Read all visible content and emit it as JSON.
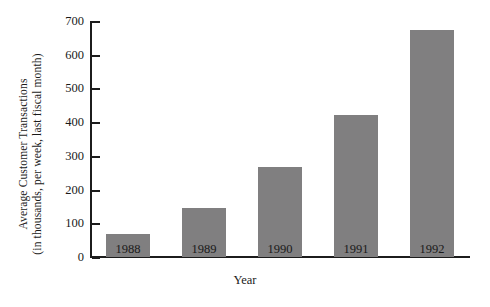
{
  "chart_data": {
    "type": "bar",
    "title": "",
    "subtitle": "",
    "categories": [
      "1988",
      "1989",
      "1990",
      "1991",
      "1992"
    ],
    "values": [
      68,
      145,
      268,
      422,
      672
    ],
    "xlabel": "Year",
    "ylabel_line1": "Average Customer Transactions",
    "ylabel_line2": "(in thousands, per week, last fiscal month)",
    "ylabel": "Average Customer Transactions (in thousands, per week, last fiscal month)",
    "ylim": [
      0,
      700
    ],
    "yticks": [
      0,
      100,
      200,
      300,
      400,
      500,
      600,
      700
    ],
    "ytick_labels": [
      "0",
      "100",
      "200",
      "300",
      "400",
      "500",
      "600",
      "700"
    ],
    "grid": false,
    "legend": null,
    "legend_position": "none",
    "bar_color": "#807f80",
    "axis_color": "#1c1c1c",
    "background_color": "#ffffff",
    "annotations": []
  }
}
